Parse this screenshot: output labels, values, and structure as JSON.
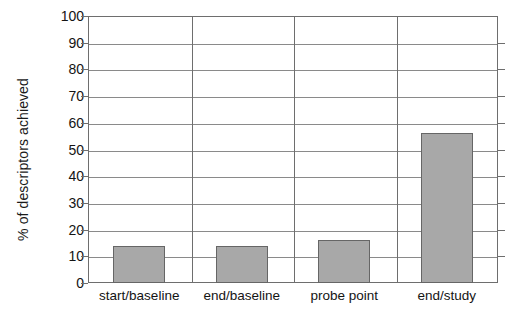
{
  "chart_data": {
    "type": "bar",
    "title": "",
    "xlabel": "",
    "ylabel": "% of descriptors achieved",
    "categories": [
      "start/baseline",
      "end/baseline",
      "probe point",
      "end/study"
    ],
    "values": [
      14,
      14,
      16,
      56
    ],
    "ylim": [
      0,
      100
    ],
    "ytick_labels": [
      "0",
      "10",
      "20",
      "30",
      "40",
      "50",
      "60",
      "70",
      "80",
      "90",
      "100"
    ],
    "ytick_values": [
      0,
      10,
      20,
      30,
      40,
      50,
      60,
      70,
      80,
      90,
      100
    ],
    "grid": "horizontal",
    "legend": "none",
    "bar_fill_color": "#a8a8a8",
    "bar_edge_color": "#666666",
    "gridline_color": "#8a8a8a",
    "axis_color": "#6e6e6e",
    "text_color": "#141414"
  }
}
